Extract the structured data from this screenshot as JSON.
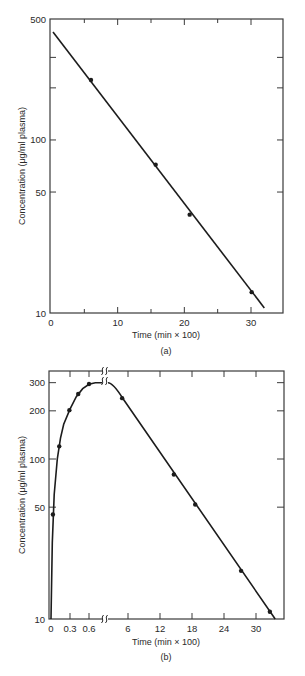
{
  "chart_data": [
    {
      "id": "a",
      "type": "scatter",
      "caption": "(a)",
      "title": "",
      "xlabel": "Time  (min × 100)",
      "ylabel": "Concentration  (μg/ml  plasma)",
      "yscale": "log",
      "ylim": [
        10,
        500
      ],
      "xlim": [
        0,
        35
      ],
      "x_ticks": [
        0,
        5,
        10,
        15,
        20,
        25,
        30
      ],
      "x_tick_labels": [
        "0",
        "",
        "10",
        "",
        "20",
        "",
        "30"
      ],
      "y_tick_labels": [
        "10",
        "50",
        "100",
        "500"
      ],
      "y_ticks": [
        10,
        50,
        100,
        200,
        300,
        500
      ],
      "grid": false,
      "series": [
        {
          "name": "observed",
          "kind": "points",
          "x": [
            6.0,
            15.7,
            20.8,
            30.1
          ],
          "y": [
            222,
            72,
            37,
            13.2
          ]
        },
        {
          "name": "fit",
          "kind": "line",
          "x": [
            0.3,
            32.0
          ],
          "y": [
            420,
            10.7
          ]
        }
      ]
    },
    {
      "id": "b",
      "type": "scatter",
      "caption": "(b)",
      "title": "",
      "xlabel": "Time  (min × 100)",
      "ylabel": "Concentration  (μg/ml  plasma)",
      "yscale": "log",
      "ylim": [
        10,
        350
      ],
      "x_axis_break": true,
      "x_segments": [
        {
          "range": [
            0,
            0.8
          ],
          "ticks": [
            0,
            0.3,
            0.6
          ],
          "tick_labels": [
            "0",
            "0.3",
            "0.6"
          ]
        },
        {
          "range": [
            3.5,
            35
          ],
          "ticks": [
            6,
            12,
            18,
            24,
            30
          ],
          "tick_labels": [
            "6",
            "12",
            "18",
            "24",
            "30"
          ]
        }
      ],
      "y_ticks": [
        10,
        50,
        100,
        200,
        300
      ],
      "y_tick_labels": [
        "10",
        "50",
        "100",
        "200",
        "300"
      ],
      "grid": false,
      "series": [
        {
          "name": "absorption phase",
          "kind": "points",
          "x": [
            0.03,
            0.13,
            0.29,
            0.43,
            0.6
          ],
          "y": [
            45,
            120,
            202,
            255,
            294
          ]
        },
        {
          "name": "elimination phase",
          "kind": "points",
          "x": [
            4.9,
            14.6,
            18.6,
            27.2,
            32.6
          ],
          "y": [
            240,
            80,
            52,
            20,
            11.1
          ]
        },
        {
          "name": "fit",
          "kind": "curve",
          "segment1": {
            "x": [
              0,
              0.02,
              0.05,
              0.1,
              0.15,
              0.2,
              0.3,
              0.4,
              0.5,
              0.6,
              0.7,
              0.8
            ],
            "y": [
              10,
              30,
              60,
              100,
              135,
              165,
              205,
              245,
              275,
              293,
              300,
              300
            ]
          },
          "segment2": {
            "x": [
              3.5,
              4.2,
              5.0,
              33.6
            ],
            "y": [
              300,
              280,
              240,
              10
            ]
          }
        }
      ]
    }
  ]
}
